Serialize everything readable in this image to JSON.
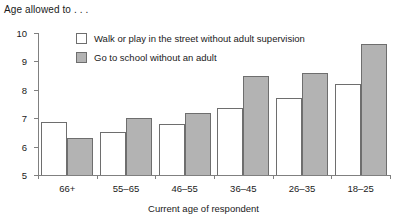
{
  "chart_data": {
    "type": "bar",
    "title": "Age allowed to . . .",
    "xlabel": "Current age of respondent",
    "ylabel": "",
    "categories": [
      "66+",
      "55–65",
      "46–55",
      "36–45",
      "26–35",
      "18–25"
    ],
    "series": [
      {
        "name": "Walk or play in the street without adult supervision",
        "color": "#ffffff",
        "values": [
          6.85,
          6.5,
          6.8,
          7.35,
          7.7,
          8.2
        ]
      },
      {
        "name": "Go to school without an adult",
        "color": "#b3b3b3",
        "values": [
          6.3,
          7.0,
          7.2,
          8.5,
          8.6,
          9.6
        ]
      }
    ],
    "ylim": [
      5,
      10
    ],
    "yticks": [
      5,
      6,
      7,
      8,
      9,
      10
    ],
    "ytick_labels": [
      "5",
      "6",
      "7",
      "8",
      "9",
      "10"
    ],
    "grid": false,
    "legend_position": "top-center"
  },
  "legend": {
    "items": [
      {
        "label": "Walk or play in the street without adult supervision",
        "swatch": "light"
      },
      {
        "label": "Go to school without an adult",
        "swatch": "dark"
      }
    ]
  }
}
